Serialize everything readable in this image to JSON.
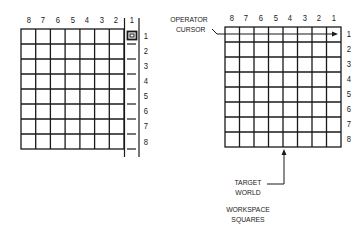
{
  "left_panel": {
    "column_labels": [
      "8",
      "7",
      "6",
      "5",
      "4",
      "3",
      "2",
      "1"
    ],
    "row_labels": [
      "1",
      "2",
      "3",
      "4",
      "5",
      "6",
      "7",
      "8"
    ],
    "cursor_marker": "square-cursor at column 1, row 1"
  },
  "right_panel": {
    "column_labels": [
      "8",
      "7",
      "6",
      "5",
      "4",
      "3",
      "2",
      "1"
    ],
    "row_labels": [
      "1",
      "2",
      "3",
      "4",
      "5",
      "6",
      "7",
      "8"
    ],
    "operator_cursor_label_line1": "OPERATOR",
    "operator_cursor_label_line2": "CURSOR",
    "target_label_line1": "TARGET",
    "target_label_line2": "WORLD",
    "workspace_label_line1": "WORKSPACE",
    "workspace_label_line2": "SQUARES"
  },
  "colors": {
    "ink": "#1a1a1a",
    "background": "#ffffff"
  }
}
